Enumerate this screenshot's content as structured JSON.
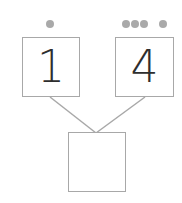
{
  "diagram": {
    "type": "number-bond",
    "parts": [
      {
        "value": "1",
        "dots": 1
      },
      {
        "value": "4",
        "dots": 4
      }
    ],
    "whole": {
      "value": ""
    },
    "colors": {
      "border": "#a8a8a8",
      "dot": "#a9a9a9",
      "text": "#2e2e2e"
    }
  }
}
